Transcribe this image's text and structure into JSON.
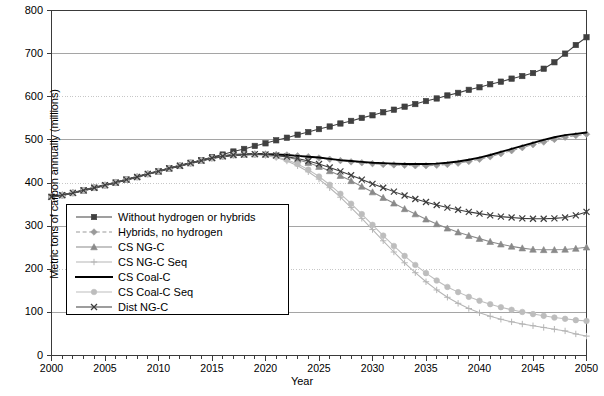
{
  "chart_data": {
    "type": "line",
    "title": "",
    "xlabel": "Year",
    "ylabel": "Metric tons of carbon annually (millions)",
    "xlim": [
      2000,
      2050
    ],
    "ylim": [
      0,
      800
    ],
    "yticks": [
      0,
      100,
      200,
      300,
      400,
      500,
      600,
      700,
      800
    ],
    "xticks": [
      2000,
      2005,
      2010,
      2015,
      2020,
      2025,
      2030,
      2035,
      2040,
      2045,
      2050
    ],
    "x_minor_tick_step": 1,
    "grid": "horizontal",
    "legend_position": "center-left-inside",
    "x": [
      2000,
      2001,
      2002,
      2003,
      2004,
      2005,
      2006,
      2007,
      2008,
      2009,
      2010,
      2011,
      2012,
      2013,
      2014,
      2015,
      2016,
      2017,
      2018,
      2019,
      2020,
      2021,
      2022,
      2023,
      2024,
      2025,
      2026,
      2027,
      2028,
      2029,
      2030,
      2031,
      2032,
      2033,
      2034,
      2035,
      2036,
      2037,
      2038,
      2039,
      2040,
      2041,
      2042,
      2043,
      2044,
      2045,
      2046,
      2047,
      2048,
      2049,
      2050
    ],
    "series": [
      {
        "name": "Without hydrogen or hybrids",
        "color": "#404040",
        "marker": "square",
        "linestyle": "solid",
        "values": [
          368,
          372,
          377,
          383,
          389,
          395,
          401,
          408,
          414,
          421,
          427,
          434,
          440,
          447,
          453,
          460,
          466,
          473,
          479,
          486,
          492,
          499,
          505,
          512,
          518,
          525,
          531,
          538,
          544,
          551,
          557,
          564,
          570,
          577,
          583,
          590,
          596,
          603,
          609,
          616,
          622,
          629,
          635,
          642,
          648,
          655,
          665,
          680,
          700,
          720,
          738
        ]
      },
      {
        "name": "Hybrids, no hydrogen",
        "color": "#9a9a9a",
        "marker": "diamond",
        "linestyle": "dashed",
        "values": [
          368,
          372,
          377,
          383,
          389,
          395,
          401,
          408,
          414,
          421,
          427,
          434,
          440,
          446,
          452,
          458,
          462,
          465,
          466,
          467,
          467,
          466,
          465,
          463,
          461,
          458,
          455,
          452,
          449,
          447,
          445,
          443,
          442,
          441,
          440,
          440,
          441,
          443,
          446,
          450,
          455,
          461,
          468,
          475,
          482,
          489,
          495,
          501,
          506,
          510,
          513
        ]
      },
      {
        "name": "CS NG-C",
        "color": "#8a8a8a",
        "marker": "triangle",
        "linestyle": "solid",
        "values": [
          368,
          372,
          377,
          383,
          389,
          395,
          401,
          408,
          414,
          421,
          427,
          434,
          440,
          446,
          452,
          458,
          462,
          465,
          466,
          467,
          466,
          464,
          460,
          454,
          447,
          438,
          428,
          417,
          405,
          392,
          379,
          366,
          353,
          340,
          328,
          316,
          305,
          295,
          286,
          278,
          271,
          264,
          258,
          253,
          249,
          246,
          245,
          245,
          246,
          248,
          251
        ]
      },
      {
        "name": "CS NG-C Seq",
        "color": "#b5b5b5",
        "marker": "plus",
        "linestyle": "solid",
        "values": [
          368,
          372,
          377,
          383,
          389,
          395,
          401,
          408,
          414,
          421,
          427,
          434,
          440,
          446,
          452,
          458,
          462,
          465,
          466,
          466,
          464,
          459,
          451,
          440,
          426,
          409,
          389,
          367,
          343,
          318,
          292,
          266,
          240,
          215,
          192,
          171,
          152,
          135,
          121,
          109,
          99,
          91,
          84,
          78,
          73,
          69,
          65,
          61,
          57,
          50,
          45
        ]
      },
      {
        "name": "CS Coal-C",
        "color": "#000000",
        "marker": "none",
        "linestyle": "solid",
        "values": [
          368,
          372,
          377,
          383,
          389,
          395,
          401,
          408,
          414,
          421,
          427,
          434,
          440,
          446,
          452,
          458,
          462,
          465,
          466,
          467,
          467,
          466,
          465,
          463,
          461,
          459,
          456,
          453,
          451,
          449,
          447,
          446,
          445,
          444,
          444,
          444,
          445,
          447,
          450,
          454,
          459,
          465,
          472,
          479,
          486,
          493,
          500,
          506,
          511,
          514,
          517
        ]
      },
      {
        "name": "CS Coal-C Seq",
        "color": "#bdbdbd",
        "marker": "circle",
        "linestyle": "solid",
        "values": [
          368,
          372,
          377,
          383,
          389,
          395,
          401,
          408,
          414,
          421,
          427,
          434,
          440,
          446,
          452,
          458,
          462,
          465,
          466,
          466,
          465,
          461,
          454,
          444,
          431,
          415,
          396,
          375,
          352,
          328,
          303,
          278,
          254,
          231,
          210,
          191,
          174,
          159,
          147,
          136,
          127,
          119,
          112,
          106,
          101,
          96,
          92,
          88,
          85,
          82,
          80
        ]
      },
      {
        "name": "Dist NG-C",
        "color": "#3d3d3d",
        "marker": "x",
        "linestyle": "solid",
        "values": [
          368,
          372,
          377,
          383,
          389,
          395,
          401,
          408,
          414,
          421,
          427,
          434,
          440,
          446,
          452,
          458,
          462,
          465,
          466,
          467,
          466,
          464,
          461,
          457,
          451,
          444,
          436,
          427,
          418,
          408,
          398,
          389,
          380,
          371,
          363,
          356,
          349,
          343,
          338,
          333,
          329,
          325,
          322,
          320,
          318,
          317,
          317,
          318,
          320,
          325,
          333
        ]
      }
    ]
  },
  "axes": {
    "y_tick_labels": [
      "800",
      "700",
      "600",
      "500",
      "400",
      "300",
      "200",
      "100",
      "0"
    ],
    "x_tick_labels": [
      "2000",
      "2005",
      "2010",
      "2015",
      "2020",
      "2025",
      "2030",
      "2035",
      "2040",
      "2045",
      "2050"
    ],
    "x_axis_title": "Year",
    "y_axis_title": "Metric tons of carbon annually (millions)"
  },
  "legend": {
    "items": [
      {
        "label": "Without hydrogen or hybrids"
      },
      {
        "label": "Hybrids, no hydrogen"
      },
      {
        "label": "CS NG-C"
      },
      {
        "label": "CS NG-C Seq"
      },
      {
        "label": "CS Coal-C"
      },
      {
        "label": "CS Coal-C Seq"
      },
      {
        "label": "Dist NG-C"
      }
    ]
  }
}
